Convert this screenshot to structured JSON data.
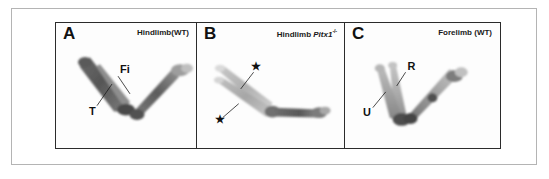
{
  "figure": {
    "background_color": "#ffffff",
    "outer_frame_color": "#b4b4b4",
    "panel_border_color": "#2b2b2b"
  },
  "panels": [
    {
      "letter": "A",
      "title_prefix": "Hindlimb(WT)",
      "gene": "",
      "genotype_superscript": "",
      "bone_labels": [
        {
          "text": "Fi",
          "meaning": "fibula"
        },
        {
          "text": "T",
          "meaning": "tibia"
        }
      ],
      "asterisks": []
    },
    {
      "letter": "B",
      "title_prefix": "Hindlimb ",
      "gene": "Pitx1",
      "genotype_superscript": "-/-",
      "bone_labels": [],
      "asterisks": [
        {
          "text": "★",
          "meaning": "asterisk-upper"
        },
        {
          "text": "★",
          "meaning": "asterisk-lower"
        }
      ]
    },
    {
      "letter": "C",
      "title_prefix": "Forelimb (WT)",
      "gene": "",
      "genotype_superscript": "",
      "bone_labels": [
        {
          "text": "R",
          "meaning": "radius"
        },
        {
          "text": "U",
          "meaning": "ulna"
        }
      ],
      "asterisks": []
    }
  ],
  "specimen_colors": {
    "bone_dark": "#5f5f5f",
    "bone_mid": "#8c8c8c",
    "bone_light": "#b9b9b9",
    "bone_pale": "#d3d3d3",
    "bone_very_pale": "#e2e2e2",
    "joint_dark": "#3d3d3d"
  }
}
